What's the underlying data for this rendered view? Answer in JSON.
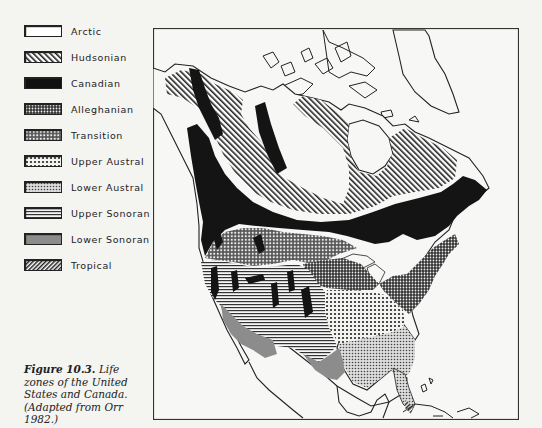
{
  "figure": {
    "caption_label": "Figure 10.3.",
    "caption_text": "Life zones of the United States and Canada. (Adapted from Orr 1982.)"
  },
  "legend": {
    "items": [
      {
        "id": "arctic",
        "label": "Arctic",
        "pattern": "blank",
        "top": 0
      },
      {
        "id": "hudsonian",
        "label": "Hudsonian",
        "pattern": "diagonal-hatch",
        "top": 26
      },
      {
        "id": "canadian",
        "label": "Canadian",
        "pattern": "solid-black",
        "top": 52
      },
      {
        "id": "alleghanian",
        "label": "Alleghanian",
        "pattern": "dense-dots",
        "top": 78
      },
      {
        "id": "transition",
        "label": "Transition",
        "pattern": "crosshatch-dots",
        "top": 104
      },
      {
        "id": "upper-austral",
        "label": "Upper Austral",
        "pattern": "large-dots",
        "top": 130
      },
      {
        "id": "lower-austral",
        "label": "Lower Austral",
        "pattern": "fine-dots",
        "top": 156
      },
      {
        "id": "upper-sonoran",
        "label": "Upper Sonoran",
        "pattern": "horizontal-lines",
        "top": 182
      },
      {
        "id": "lower-sonoran",
        "label": "Lower Sonoran",
        "pattern": "solid-gray",
        "top": 208
      },
      {
        "id": "tropical",
        "label": "Tropical",
        "pattern": "reverse-diagonal-hatch",
        "top": 234
      }
    ]
  },
  "colors": {
    "paper": "#f4f4f1",
    "ink": "#1a1a1a",
    "lower_sonoran_gray": "#8c8c8c"
  }
}
